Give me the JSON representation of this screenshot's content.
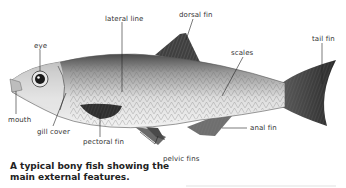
{
  "diagram": {
    "subject": "bony fish",
    "labels": {
      "eye": "eye",
      "lateral_line": "lateral line",
      "dorsal_fin": "dorsal fin",
      "scales": "scales",
      "tail_fin": "tail fin",
      "mouth": "mouth",
      "gill_cover": "gill cover",
      "pectoral_fin": "pectoral fin",
      "pelvic_fins": "pelvic fins",
      "anal_fin": "anal fin"
    },
    "caption_line1": "A typical bony fish showing the",
    "caption_line2": "main external features."
  },
  "colors": {
    "body_light": "#d9d9d9",
    "body_dark": "#555555",
    "fin_dark": "#3a3a3a",
    "leader_line": "#222222",
    "text": "#333333"
  }
}
